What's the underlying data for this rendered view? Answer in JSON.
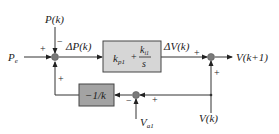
{
  "diagram": {
    "type": "control-block-diagram",
    "inputs": {
      "pe_label": "P",
      "pe_sub": "e",
      "pk_label": "P(k)",
      "va1_label": "V",
      "va1_sub": "a1",
      "vk_label": "V(k)"
    },
    "signals": {
      "delta_p": "ΔP(k)",
      "delta_v": "ΔV(k)",
      "output": "V(k+1)"
    },
    "blocks": {
      "pi_controller": {
        "kp_main": "k",
        "kp_sub": "p1",
        "plus": "+",
        "ki_main": "k",
        "ki_sub": "i1",
        "denominator": "s",
        "fill": "#d6d6d6"
      },
      "gain": {
        "label": "−1/k",
        "fill": "#a3a3a3"
      }
    },
    "signs": {
      "left_junction_pe": "+",
      "left_junction_pk": "−",
      "left_junction_feedback": "+",
      "right_junction_dv": "+",
      "right_junction_vk": "+",
      "bottom_junction_va1": "−",
      "bottom_junction_vk": "+"
    },
    "colors": {
      "line": "#333333",
      "junction": "#777777"
    }
  }
}
